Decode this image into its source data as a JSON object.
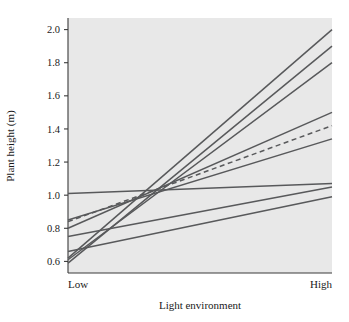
{
  "chart_data": {
    "type": "line",
    "title": "",
    "subtitle": "",
    "xlabel": "Light environment",
    "ylabel": "Plant height (m)",
    "x": [
      "Low",
      "High"
    ],
    "xtick_labels": [
      "Low",
      "High"
    ],
    "ytick_labels": [
      "0.6",
      "0.8",
      "1.0",
      "1.2",
      "1.4",
      "1.6",
      "1.8",
      "2.0"
    ],
    "ytick_values": [
      0.6,
      0.8,
      1.0,
      1.2,
      1.4,
      1.6,
      1.8,
      2.0
    ],
    "ylim": [
      0.53,
      2.07
    ],
    "grid": false,
    "legend": null,
    "legend_position": "none",
    "plot_background": "#e8e8e8",
    "line_color": "#58595b",
    "annotations": [],
    "series": [
      {
        "name": "genotype-1",
        "values": [
          1.01,
          1.07
        ],
        "style": "solid"
      },
      {
        "name": "genotype-2",
        "values": [
          0.85,
          1.34
        ],
        "style": "solid"
      },
      {
        "name": "genotype-3",
        "values": [
          0.8,
          1.5
        ],
        "style": "solid"
      },
      {
        "name": "genotype-4",
        "values": [
          0.75,
          1.05
        ],
        "style": "solid"
      },
      {
        "name": "genotype-5",
        "values": [
          0.66,
          0.99
        ],
        "style": "solid"
      },
      {
        "name": "genotype-6",
        "values": [
          0.62,
          2.0
        ],
        "style": "solid"
      },
      {
        "name": "genotype-7",
        "values": [
          0.59,
          1.9
        ],
        "style": "solid"
      },
      {
        "name": "genotype-8",
        "values": [
          0.61,
          1.8
        ],
        "style": "solid"
      },
      {
        "name": "population-mean",
        "values": [
          0.84,
          1.42
        ],
        "style": "dashed"
      }
    ]
  },
  "axes": {
    "y_title": "Plant height (m)",
    "x_title": "Light environment",
    "x_categories": [
      "Low",
      "High"
    ],
    "y_ticks": [
      "2.0",
      "1.8",
      "1.6",
      "1.4",
      "1.2",
      "1.0",
      "0.8",
      "0.6"
    ]
  }
}
